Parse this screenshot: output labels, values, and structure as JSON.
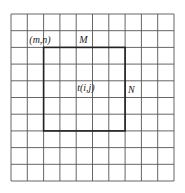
{
  "diagram": {
    "title": "",
    "grid": {
      "cols": 10,
      "rows": 10,
      "x0": 11,
      "y0": 14,
      "x1": 174,
      "y1": 181,
      "line_color": "#555555",
      "line_width": 0.9
    },
    "highlight_rect": {
      "col_start": 2,
      "row_start": 2,
      "col_end": 7,
      "row_end": 7,
      "line_color": "#222222",
      "line_width": 1.6
    },
    "labels": {
      "corner": "(m,n)",
      "width": "M",
      "height": "N",
      "template": "t(i,j)"
    },
    "colors": {
      "background": "#ffffff",
      "text": "#222222"
    }
  }
}
